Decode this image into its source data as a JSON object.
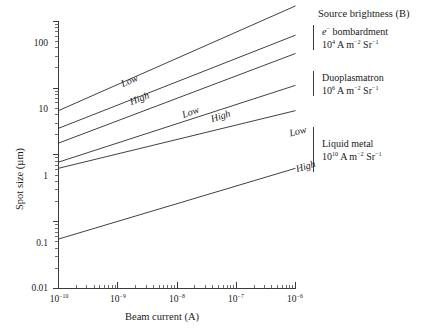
{
  "figure": {
    "background_color": "#ffffff",
    "line_color": "#2a2a2a"
  },
  "chart_data": {
    "type": "line",
    "title": "",
    "xlabel": "Beam current (A)",
    "ylabel": "Spot size (µm)",
    "xscale": "log",
    "yscale": "log",
    "xlim": [
      1e-10,
      1e-06
    ],
    "ylim": [
      0.01,
      300
    ],
    "grid": false,
    "legend_position": "right",
    "x_tick_labels": [
      "10⁻¹⁰",
      "10⁻⁹",
      "10⁻⁸",
      "10⁻⁷",
      "10⁻⁶"
    ],
    "x_tick_bases": [
      "10",
      "10",
      "10",
      "10",
      "10"
    ],
    "x_tick_exponents": [
      "-10",
      "-9",
      "-8",
      "-7",
      "-6"
    ],
    "y_tick_labels": [
      "100",
      "10",
      "1",
      "0.1",
      "0.01"
    ],
    "y_tick_values": [
      100,
      10,
      1,
      0.1,
      0.01
    ],
    "series": [
      {
        "name": "e- bombardment Low",
        "group": "e- bombardment",
        "aberration": "Low",
        "label": "Low",
        "x": [
          1e-10,
          1e-06
        ],
        "y": [
          4.6,
          170.0
        ],
        "label_x": 1.6e-09,
        "label_y": 11.5
      },
      {
        "name": "e- bombardment High",
        "group": "e- bombardment",
        "aberration": "High",
        "label": "High",
        "x": [
          1e-10,
          1e-06
        ],
        "y": [
          2.5,
          62.0
        ],
        "label_x": 2.4e-09,
        "label_y": 6.2
      },
      {
        "name": "Duoplasmatron Low",
        "group": "Duoplasmatron",
        "aberration": "Low",
        "label": "Low",
        "x": [
          1e-10,
          1e-06
        ],
        "y": [
          1.5,
          33.0
        ],
        "label_x": 1.7e-08,
        "label_y": 3.9
      },
      {
        "name": "Duoplasmatron High",
        "group": "Duoplasmatron",
        "aberration": "High",
        "label": "High",
        "x": [
          1e-10,
          1e-06
        ],
        "y": [
          0.78,
          11.0
        ],
        "label_x": 5.5e-08,
        "label_y": 3.4
      },
      {
        "name": "Liquid metal Low",
        "group": "Liquid metal",
        "aberration": "Low",
        "label": "Low",
        "x": [
          1e-10,
          1e-06
        ],
        "y": [
          0.63,
          4.6
        ],
        "label_x": 1.1e-06,
        "label_y": 2.1
      },
      {
        "name": "Liquid metal High",
        "group": "Liquid metal",
        "aberration": "High",
        "label": "High",
        "x": [
          1e-10,
          1e-06
        ],
        "y": [
          0.055,
          0.63
        ],
        "label_x": 1.5e-06,
        "label_y": 0.62
      }
    ],
    "annotations": [
      {
        "text": "Source brightness (B)",
        "role": "legend-heading"
      },
      {
        "text": "e⁻ bombardment",
        "value": "10⁴ A m⁻² Sr⁻¹",
        "role": "legend-entry"
      },
      {
        "text": "Duoplasmatron",
        "value": "10⁶ A m⁻² Sr⁻¹",
        "role": "legend-entry"
      },
      {
        "text": "Liquid metal",
        "value": "10¹⁰ A m⁻² Sr⁻¹",
        "role": "legend-entry"
      }
    ]
  },
  "axes": {
    "y_title": "Spot size (µm)",
    "x_title": "Beam current (A)",
    "y_ticks": [
      {
        "label": "100"
      },
      {
        "label": "10"
      },
      {
        "label": "1"
      },
      {
        "label": "0.1"
      },
      {
        "label": "0.01"
      }
    ],
    "x_ticks": [
      {
        "base": "10",
        "exp": "−10"
      },
      {
        "base": "10",
        "exp": "−9"
      },
      {
        "base": "10",
        "exp": "−8"
      },
      {
        "base": "10",
        "exp": "−7"
      },
      {
        "base": "10",
        "exp": "−6"
      }
    ]
  },
  "curve_labels": [
    {
      "text": "Low"
    },
    {
      "text": "High"
    },
    {
      "text": "Low"
    },
    {
      "text": "High"
    },
    {
      "text": "Low"
    },
    {
      "text": "High"
    }
  ],
  "legend": {
    "heading": "Source brightness (B)",
    "entries": [
      {
        "name_prefix": "e",
        "name_sup": "−",
        "name_rest": " bombardment",
        "value_base": "10",
        "value_exp": "4",
        "value_unit_a": " A m",
        "value_unit_a_exp": "−2",
        "value_unit_b": " Sr",
        "value_unit_b_exp": "−1"
      },
      {
        "name_prefix": "",
        "name_sup": "",
        "name_rest": "Duoplasmatron",
        "value_base": "10",
        "value_exp": "6",
        "value_unit_a": " A m",
        "value_unit_a_exp": "−2",
        "value_unit_b": " Sr",
        "value_unit_b_exp": "−1"
      },
      {
        "name_prefix": "",
        "name_sup": "",
        "name_rest": "Liquid metal",
        "value_base": "10",
        "value_exp": "10",
        "value_unit_a": " A m",
        "value_unit_a_exp": "−2",
        "value_unit_b": " Sr",
        "value_unit_b_exp": "−1"
      }
    ]
  }
}
